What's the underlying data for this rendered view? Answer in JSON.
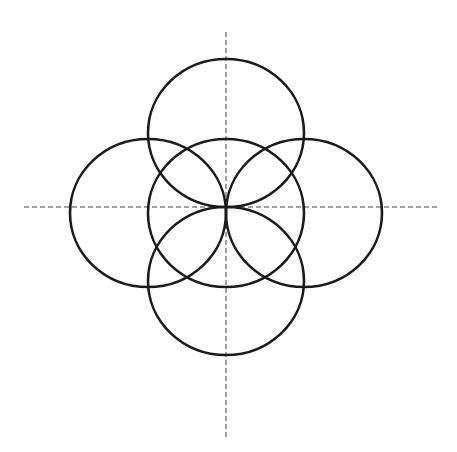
{
  "diagram": {
    "type": "geometric-construction",
    "canvas": {
      "width": 457,
      "height": 452,
      "background": "#ffffff"
    },
    "stroke_color": "#1a1a1a",
    "stroke_width": 2.6,
    "axis_color": "#444444",
    "axis_dash": "5 3",
    "center_point": {
      "x": 226,
      "y": 207
    },
    "axes": [
      {
        "id": "horizontal-axis",
        "x1": 24,
        "y1": 207,
        "x2": 437,
        "y2": 207
      },
      {
        "id": "vertical-axis",
        "x1": 226,
        "y1": 32,
        "x2": 226,
        "y2": 440
      }
    ],
    "circles": [
      {
        "id": "top",
        "cx": 226,
        "cy": 133,
        "rx": 78,
        "ry": 74
      },
      {
        "id": "left",
        "cx": 148,
        "cy": 213,
        "rx": 78,
        "ry": 74
      },
      {
        "id": "center",
        "cx": 226,
        "cy": 213,
        "rx": 78,
        "ry": 74
      },
      {
        "id": "right",
        "cx": 304,
        "cy": 213,
        "rx": 78,
        "ry": 74
      },
      {
        "id": "bottom",
        "cx": 226,
        "cy": 281,
        "rx": 78,
        "ry": 74
      }
    ]
  }
}
